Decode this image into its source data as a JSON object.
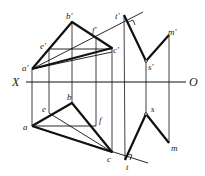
{
  "axis": {
    "left_label": "X",
    "right_label": "O"
  },
  "labels": {
    "a_prime": "a'",
    "b_prime": "b'",
    "c_prime": "c'",
    "e_prime": "e'",
    "f_prime": "f'",
    "t_prime": "t'",
    "s_prime": "s'",
    "m_prime": "m'",
    "a": "a",
    "b": "b",
    "c": "c",
    "e": "e",
    "f": "f",
    "t": "t",
    "s": "s",
    "m": "m"
  },
  "points": {
    "front": {
      "a": [
        32,
        69
      ],
      "b": [
        72,
        22
      ],
      "c": [
        112,
        48
      ],
      "e": [
        49,
        49
      ],
      "f": [
        96,
        38
      ],
      "t": [
        124,
        15
      ],
      "s": [
        146,
        61
      ],
      "m": [
        169,
        35
      ]
    },
    "top": {
      "a": [
        32,
        126
      ],
      "b": [
        72,
        103
      ],
      "c": [
        112,
        152
      ],
      "e": [
        49,
        113
      ],
      "f": [
        96,
        126
      ],
      "t": [
        125,
        160
      ],
      "s": [
        146,
        114
      ],
      "m": [
        169,
        143
      ]
    }
  },
  "colors": {
    "line": "#111111",
    "background": "#ffffff"
  }
}
